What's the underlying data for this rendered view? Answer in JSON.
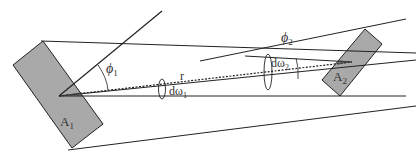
{
  "diagram": {
    "type": "radiative view factor geometry",
    "colors": {
      "surface_fill": "#a9a9a9",
      "stroke": "#222222",
      "background": "#ffffff"
    },
    "surfaces": [
      {
        "id": "A1",
        "label": "A",
        "subscript": "1"
      },
      {
        "id": "A2",
        "label": "A",
        "subscript": "2"
      }
    ],
    "labels": {
      "phi1": {
        "symbol": "ϕ",
        "subscript": "1"
      },
      "phi2": {
        "symbol": "ϕ",
        "subscript": "2"
      },
      "r": "r",
      "domega1": {
        "prefix": "dω",
        "subscript": "1"
      },
      "domega2": {
        "prefix": "dω",
        "subscript": "2"
      }
    }
  }
}
